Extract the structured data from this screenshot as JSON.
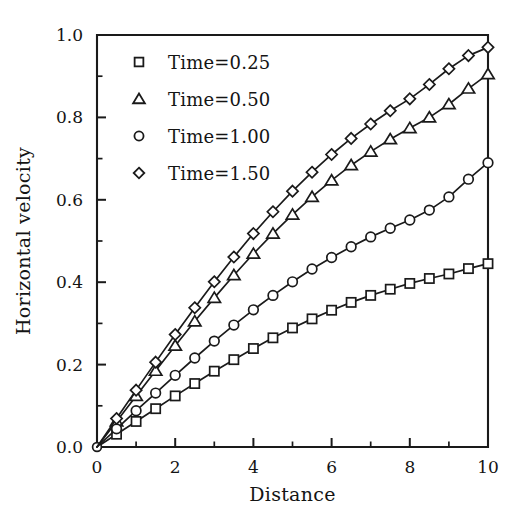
{
  "chart_data": {
    "type": "line",
    "title": "",
    "xlabel": "Distance",
    "ylabel": "Horizontal velocity",
    "xlim": [
      0,
      10
    ],
    "ylim": [
      0.0,
      1.0
    ],
    "xticks": [
      0,
      2,
      4,
      6,
      8,
      10
    ],
    "xtick_labels": [
      "0",
      "2",
      "4",
      "6",
      "8",
      "10"
    ],
    "xminor_step": 1,
    "yticks": [
      0.0,
      0.2,
      0.4,
      0.6,
      0.8,
      1.0
    ],
    "ytick_labels": [
      "0.0",
      "0.2",
      "0.4",
      "0.6",
      "0.8",
      "1.0"
    ],
    "yminor_step": 0.1,
    "grid": false,
    "legend_position": "upper-left-inside",
    "line_color": "#1a1a1a",
    "marker_fill": "#ffffff",
    "x": [
      0,
      0.5,
      1.0,
      1.5,
      2.0,
      2.5,
      3.0,
      3.5,
      4.0,
      4.5,
      5.0,
      5.5,
      6.0,
      6.5,
      7.0,
      7.5,
      8.0,
      8.5,
      9.0,
      9.5,
      10.0
    ],
    "series": [
      {
        "name": "Time=0.25",
        "marker": "square",
        "values": [
          0.0,
          0.031,
          0.062,
          0.093,
          0.124,
          0.154,
          0.184,
          0.212,
          0.239,
          0.265,
          0.289,
          0.311,
          0.332,
          0.351,
          0.368,
          0.383,
          0.397,
          0.409,
          0.42,
          0.433,
          0.445
        ]
      },
      {
        "name": "Time=0.50",
        "marker": "triangle",
        "values": [
          0.0,
          0.062,
          0.124,
          0.185,
          0.246,
          0.305,
          0.362,
          0.417,
          0.469,
          0.518,
          0.564,
          0.607,
          0.647,
          0.684,
          0.717,
          0.747,
          0.774,
          0.8,
          0.832,
          0.87,
          0.905
        ]
      },
      {
        "name": "Time=1.00",
        "marker": "circle",
        "values": [
          0.0,
          0.044,
          0.088,
          0.131,
          0.174,
          0.216,
          0.257,
          0.296,
          0.333,
          0.368,
          0.401,
          0.432,
          0.46,
          0.486,
          0.51,
          0.531,
          0.551,
          0.575,
          0.607,
          0.65,
          0.69
        ]
      },
      {
        "name": "Time=1.50",
        "marker": "diamond",
        "values": [
          0.0,
          0.069,
          0.138,
          0.206,
          0.273,
          0.338,
          0.401,
          0.461,
          0.518,
          0.571,
          0.621,
          0.667,
          0.71,
          0.749,
          0.784,
          0.816,
          0.845,
          0.88,
          0.918,
          0.95,
          0.97
        ]
      }
    ]
  },
  "legend": {
    "entries": [
      {
        "label": "Time=0.25",
        "marker": "square"
      },
      {
        "label": "Time=0.50",
        "marker": "triangle"
      },
      {
        "label": "Time=1.00",
        "marker": "circle"
      },
      {
        "label": "Time=1.50",
        "marker": "diamond"
      }
    ]
  }
}
